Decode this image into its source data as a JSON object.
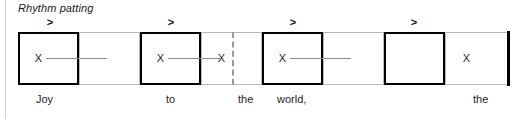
{
  "title": "Rhythm patting",
  "colors": {
    "accent_border": "#000000",
    "plain_border": "#b9b9b9",
    "tie_line": "#8a8a8a",
    "dashed_barline": "#9a9a9a",
    "text": "#1d1d1d",
    "page_rule": "#d2d2d2"
  },
  "notation": {
    "accent_symbol": ">",
    "beat_symbol": "X",
    "accent_marks": [
      {
        "label": ">",
        "left": 43
      },
      {
        "label": ">",
        "left": 164
      },
      {
        "label": ">",
        "left": 286
      },
      {
        "label": ">",
        "left": 407
      }
    ],
    "cells": [
      {
        "index": 1,
        "style": "accented",
        "left": 0,
        "width": 61,
        "beat": "X",
        "tie_length": 61
      },
      {
        "index": 2,
        "style": "plain",
        "left": 61,
        "width": 61,
        "beat": "",
        "tie_length": 0
      },
      {
        "index": 3,
        "style": "accented",
        "left": 122,
        "width": 61,
        "beat": "X",
        "tie_length": 52
      },
      {
        "index": 4,
        "style": "plain",
        "left": 183,
        "width": 61,
        "beat": "X",
        "tie_length": 0
      },
      {
        "index": 5,
        "style": "accented",
        "left": 244,
        "width": 61,
        "beat": "X",
        "tie_length": 61
      },
      {
        "index": 6,
        "style": "plain",
        "left": 305,
        "width": 61,
        "beat": "",
        "tie_length": 0
      },
      {
        "index": 7,
        "style": "accented",
        "left": 366,
        "width": 61,
        "beat": "",
        "tie_length": 0
      },
      {
        "index": 8,
        "style": "plain",
        "left": 427,
        "width": 63,
        "beat": "X",
        "tie_length": 0
      }
    ],
    "dashed_barline_left": 214
  },
  "lyrics": [
    {
      "text": "Joy",
      "left": 36
    },
    {
      "text": "to",
      "left": 166
    },
    {
      "text": "the",
      "left": 238
    },
    {
      "text": "world,",
      "left": 277
    },
    {
      "text": "the",
      "left": 473
    }
  ]
}
